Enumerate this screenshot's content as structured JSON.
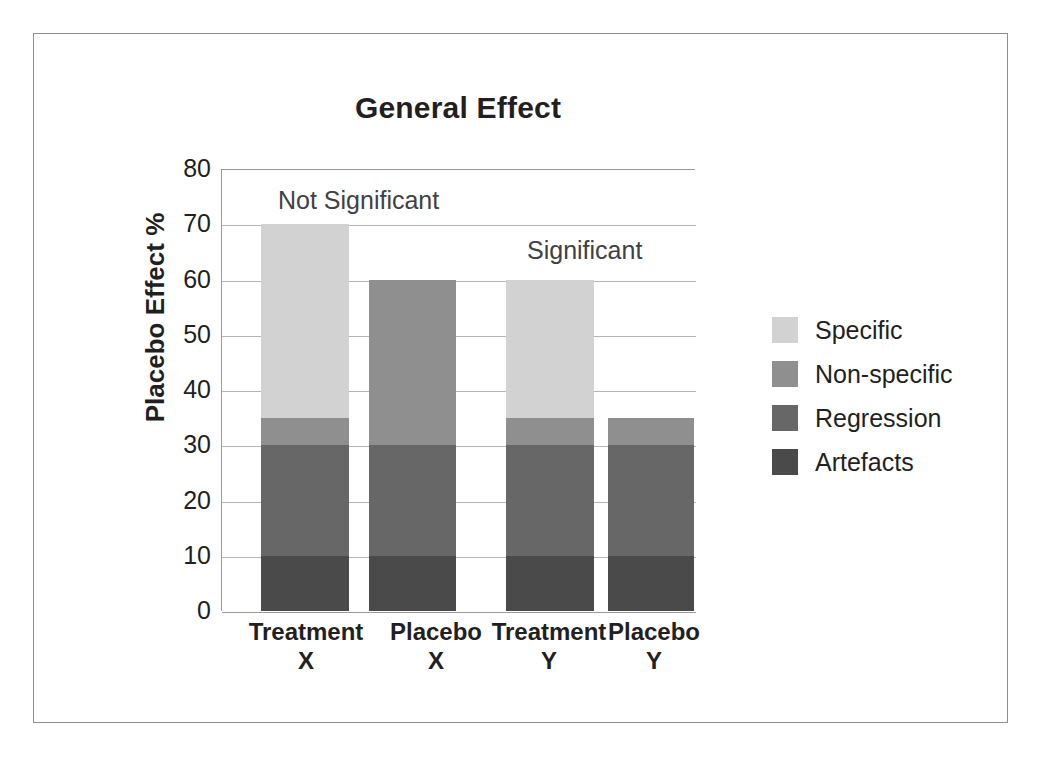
{
  "figure": {
    "title": "General Effect",
    "frame_color": "#8d8d8d"
  },
  "chart_data": {
    "type": "bar",
    "subtype": "stacked",
    "title": "General Effect",
    "xlabel": "",
    "ylabel": "Placebo Effect %",
    "ylim": [
      0,
      80
    ],
    "ytick_step": 10,
    "yticks": [
      80,
      70,
      60,
      50,
      40,
      30,
      20,
      10,
      0
    ],
    "grid": true,
    "grid_axis": "y",
    "legend_position": "right",
    "categories": [
      "Treatment X",
      "Placebo X",
      "Treatment Y",
      "Placebo Y"
    ],
    "category_lines": [
      [
        "Treatment",
        "X"
      ],
      [
        "Placebo",
        "X"
      ],
      [
        "Treatment",
        "Y"
      ],
      [
        "Placebo",
        "Y"
      ]
    ],
    "series": [
      {
        "name": "Artefacts",
        "color": "#4a4a4a",
        "values": [
          10,
          10,
          10,
          10
        ]
      },
      {
        "name": "Regression",
        "color": "#676767",
        "values": [
          20,
          20,
          20,
          20
        ]
      },
      {
        "name": "Non-specific",
        "color": "#8f8f8f",
        "values": [
          5,
          30,
          5,
          5
        ]
      },
      {
        "name": "Specific",
        "color": "#d2d2d2",
        "values": [
          35,
          0,
          25,
          0
        ]
      }
    ],
    "totals": [
      70,
      60,
      60,
      35
    ],
    "annotations": [
      {
        "text": "Not Significant",
        "x_value": 0.18,
        "y_value": 75
      },
      {
        "text": "Significant",
        "x_value": 0.66,
        "y_value": 65
      }
    ]
  },
  "legend": {
    "items": [
      {
        "label": "Specific",
        "color": "#d2d2d2"
      },
      {
        "label": "Non-specific",
        "color": "#8f8f8f"
      },
      {
        "label": "Regression",
        "color": "#676767"
      },
      {
        "label": "Artefacts",
        "color": "#4a4a4a"
      }
    ]
  },
  "layout": {
    "plot": {
      "left": 221,
      "top": 169,
      "width": 474,
      "height": 442
    },
    "bars": [
      {
        "left": 39,
        "width": 88
      },
      {
        "left": 147,
        "width": 87
      },
      {
        "left": 284,
        "width": 88
      },
      {
        "left": 386,
        "width": 86
      }
    ],
    "x_label_slots": [
      {
        "left": -10,
        "width": 190
      },
      {
        "left": 120,
        "width": 190
      },
      {
        "left": 233,
        "width": 190
      },
      {
        "left": 338,
        "width": 190
      }
    ],
    "annotations_px": [
      {
        "left": 56,
        "top": 16
      },
      {
        "left": 305,
        "top": 66
      }
    ]
  }
}
